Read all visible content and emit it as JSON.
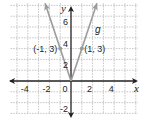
{
  "chart_data": {
    "type": "line",
    "title": "",
    "xlabel": "x",
    "ylabel": "y",
    "xlim": [
      -5.6,
      6.2
    ],
    "ylim": [
      -3,
      7.2
    ],
    "grid": true,
    "x_ticks": [
      -4,
      -2,
      0,
      2,
      4
    ],
    "y_ticks": [
      -2,
      2,
      4,
      6
    ],
    "x_tick_labels": [
      "-4",
      "-2",
      "0",
      "2",
      "4"
    ],
    "y_tick_labels": [
      "-2",
      "2",
      "4",
      "6"
    ],
    "series": [
      {
        "name": "g",
        "equation": "g(x) = 3|x|",
        "x": [
          -2.4,
          0,
          2.4
        ],
        "y": [
          7.2,
          0,
          7.2
        ],
        "color": "#9b9b9b"
      }
    ],
    "points": [
      {
        "x": -1,
        "y": 3,
        "label": "(-1, 3)"
      },
      {
        "x": 1,
        "y": 3,
        "label": "(1, 3)"
      }
    ],
    "function_label": "g",
    "colors": {
      "axis": "#231f20",
      "grid": "#b5b5b5",
      "curve": "#9b9b9b"
    }
  }
}
